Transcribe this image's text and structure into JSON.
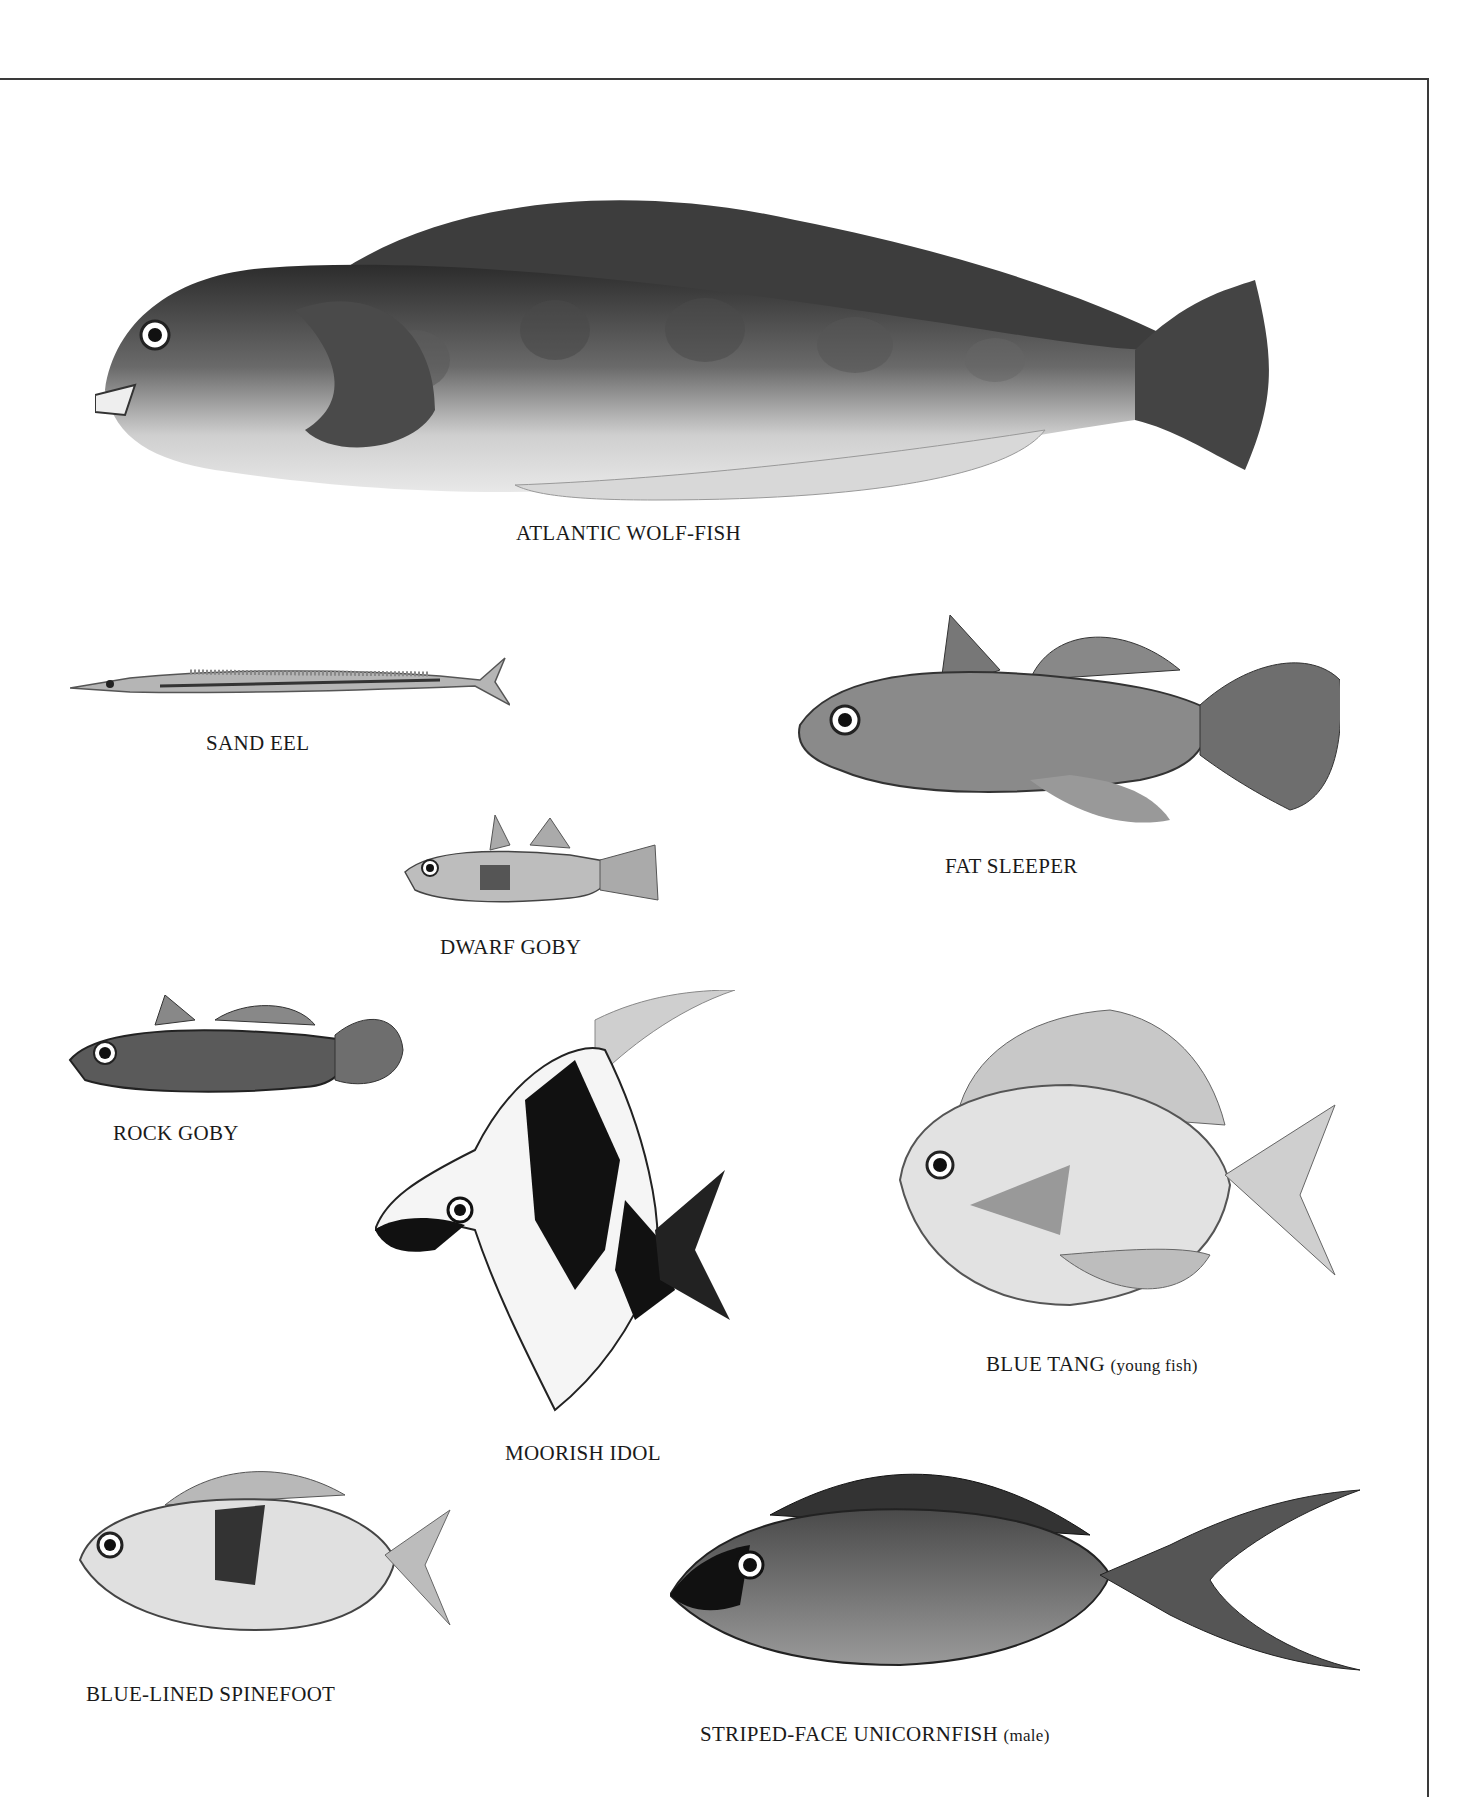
{
  "plate": {
    "border_color": "#3a3a3a",
    "background": "#ffffff"
  },
  "fishes": [
    {
      "id": "atlantic-wolf-fish",
      "name": "ATLANTIC WOLF-FISH",
      "note": ""
    },
    {
      "id": "sand-eel",
      "name": "SAND EEL",
      "note": ""
    },
    {
      "id": "fat-sleeper",
      "name": "FAT SLEEPER",
      "note": ""
    },
    {
      "id": "dwarf-goby",
      "name": "DWARF GOBY",
      "note": ""
    },
    {
      "id": "rock-goby",
      "name": "ROCK GOBY",
      "note": ""
    },
    {
      "id": "moorish-idol",
      "name": "MOORISH IDOL",
      "note": ""
    },
    {
      "id": "blue-tang",
      "name": "BLUE TANG",
      "note": "(young fish)"
    },
    {
      "id": "blue-lined-spinefoot",
      "name": "BLUE-LINED SPINEFOOT",
      "note": ""
    },
    {
      "id": "striped-face-unicornfish",
      "name": "STRIPED-FACE UNICORNFISH",
      "note": "(male)"
    }
  ]
}
